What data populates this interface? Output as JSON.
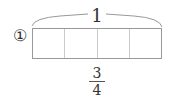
{
  "diagram": {
    "label_number": "①",
    "whole_label": "1",
    "segments": 4,
    "fraction": {
      "numerator": "3",
      "denominator": "4"
    },
    "colors": {
      "stroke": "#999999",
      "divider": "#cccccc",
      "text": "#333333"
    }
  }
}
